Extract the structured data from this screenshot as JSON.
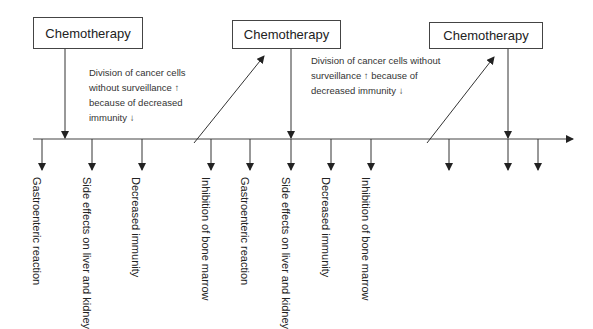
{
  "diagram": {
    "type": "timeline",
    "colors": {
      "line": "#333333",
      "text": "#222222",
      "box_border": "#444444"
    },
    "chemo_boxes": [
      {
        "label": "Chemotherapy"
      },
      {
        "label": "Chemotherapy"
      },
      {
        "label": "Chemotherapy"
      }
    ],
    "notes": [
      {
        "lines": [
          "Division of cancer cells",
          "without surveillance ↑",
          "because of decreased",
          "immunity ↓"
        ]
      },
      {
        "lines": [
          "Division of cancer cells without",
          "surveillance ↑ because of",
          "decreased immunity ↓"
        ]
      }
    ],
    "effects": [
      {
        "lines": [
          "Gastroenteric",
          "reaction"
        ]
      },
      {
        "lines": [
          "Side effects on liver",
          "and kidney"
        ]
      },
      {
        "lines": [
          "Decreased",
          "immunity"
        ]
      },
      {
        "lines": [
          "Inhibition of bone",
          "marrow"
        ]
      },
      {
        "lines": [
          "Gastroenteric",
          "reaction"
        ]
      },
      {
        "lines": [
          "Side effects on liver",
          "and kidney"
        ]
      },
      {
        "lines": [
          "Decreased",
          "immunity"
        ]
      },
      {
        "lines": [
          "Inhibition of bone",
          "marrow"
        ]
      }
    ]
  }
}
